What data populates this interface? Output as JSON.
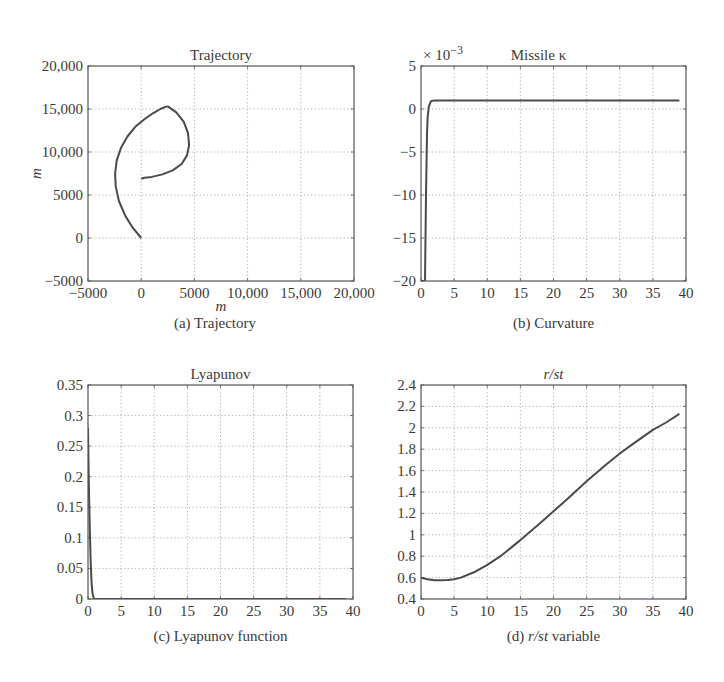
{
  "figure": {
    "line_color": "#4a4a4a",
    "grid_color": "#9a9a9a",
    "axis_color": "#555555"
  },
  "chart_data": [
    {
      "id": "a",
      "type": "line",
      "title": "Trajectory",
      "caption": "(a) Trajectory",
      "xlabel": "m",
      "ylabel": "m",
      "xlim": [
        -5000,
        20000
      ],
      "ylim": [
        -5000,
        20000
      ],
      "xticks": [
        -5000,
        0,
        5000,
        10000,
        15000,
        20000
      ],
      "xtick_labels": [
        "−5000",
        "0",
        "5000",
        "10,000",
        "15,000",
        "20,000"
      ],
      "yticks": [
        -5000,
        0,
        5000,
        10000,
        15000,
        20000
      ],
      "ytick_labels": [
        "−5000",
        "0",
        "5000",
        "10,000",
        "15,000",
        "20,000"
      ],
      "grid": true,
      "exponent_label": "",
      "series": [
        {
          "name": "missile-path",
          "x": [
            0,
            -800,
            -1500,
            -2100,
            -2400,
            -2450,
            -2300,
            -1900,
            -1300,
            -500,
            300,
            1100,
            1800,
            2400,
            2500
          ],
          "y": [
            0,
            1200,
            2600,
            4300,
            6000,
            7500,
            9000,
            10500,
            11800,
            13000,
            13800,
            14500,
            15000,
            15300,
            15300
          ]
        },
        {
          "name": "target-path",
          "x": [
            2500,
            3300,
            4000,
            4400,
            4500,
            4300,
            3800,
            3000,
            2000,
            1000,
            300,
            0
          ],
          "y": [
            15300,
            14600,
            13500,
            12200,
            10800,
            9600,
            8600,
            7900,
            7400,
            7100,
            7000,
            6900
          ]
        }
      ]
    },
    {
      "id": "b",
      "type": "line",
      "title": "Missile κ",
      "caption": "(b) Curvature",
      "xlabel": "",
      "ylabel": "",
      "exponent_label": "× 10−3",
      "xlim": [
        0,
        40
      ],
      "ylim": [
        -20,
        5
      ],
      "xticks": [
        0,
        5,
        10,
        15,
        20,
        25,
        30,
        35,
        40
      ],
      "xtick_labels": [
        "0",
        "5",
        "10",
        "15",
        "20",
        "25",
        "30",
        "35",
        "40"
      ],
      "yticks": [
        -20,
        -15,
        -10,
        -5,
        0,
        5
      ],
      "ytick_labels": [
        "−20",
        "−15",
        "−10",
        "−5",
        "0",
        "5"
      ],
      "grid": true,
      "series": [
        {
          "name": "curvature",
          "x": [
            0,
            0.6,
            0.75,
            0.9,
            1.0,
            1.2,
            1.5,
            2,
            5,
            10,
            20,
            30,
            39
          ],
          "y": [
            -20,
            -20,
            -10,
            -3,
            -1,
            0.3,
            0.9,
            1.0,
            1.0,
            1.0,
            1.0,
            1.0,
            1.0
          ]
        }
      ]
    },
    {
      "id": "c",
      "type": "line",
      "title": "Lyapunov",
      "caption": "(c) Lyapunov function",
      "xlabel": "",
      "ylabel": "",
      "exponent_label": "",
      "xlim": [
        0,
        40
      ],
      "ylim": [
        0,
        0.35
      ],
      "xticks": [
        0,
        5,
        10,
        15,
        20,
        25,
        30,
        35,
        40
      ],
      "xtick_labels": [
        "0",
        "5",
        "10",
        "15",
        "20",
        "25",
        "30",
        "35",
        "40"
      ],
      "yticks": [
        0,
        0.05,
        0.1,
        0.15,
        0.2,
        0.25,
        0.3,
        0.35
      ],
      "ytick_labels": [
        "0",
        "0.05",
        "0.1",
        "0.15",
        "0.2",
        "0.25",
        "0.3",
        "0.35"
      ],
      "grid": true,
      "series": [
        {
          "name": "lyapunov",
          "x": [
            0,
            0.1,
            0.25,
            0.4,
            0.55,
            0.7,
            0.85,
            1.0,
            5,
            20,
            39
          ],
          "y": [
            0.28,
            0.2,
            0.12,
            0.06,
            0.025,
            0.008,
            0.002,
            0,
            0,
            0,
            0
          ]
        }
      ]
    },
    {
      "id": "d",
      "type": "line",
      "title": "r/st",
      "caption": "(d) r/st variable",
      "xlabel": "",
      "ylabel": "",
      "exponent_label": "",
      "xlim": [
        0,
        40
      ],
      "ylim": [
        0.4,
        2.4
      ],
      "xticks": [
        0,
        5,
        10,
        15,
        20,
        25,
        30,
        35,
        40
      ],
      "xtick_labels": [
        "0",
        "5",
        "10",
        "15",
        "20",
        "25",
        "30",
        "35",
        "40"
      ],
      "yticks": [
        0.4,
        0.6,
        0.8,
        1.0,
        1.2,
        1.4,
        1.6,
        1.8,
        2.0,
        2.2,
        2.4
      ],
      "ytick_labels": [
        "0.4",
        "0.6",
        "0.8",
        "1",
        "1.2",
        "1.4",
        "1.6",
        "1.8",
        "2",
        "2.2",
        "2.4"
      ],
      "grid": true,
      "series": [
        {
          "name": "r-over-st",
          "x": [
            0,
            1,
            2,
            3,
            4,
            5,
            6,
            8,
            10,
            12,
            15,
            18,
            20,
            22,
            25,
            28,
            30,
            32,
            35,
            37,
            39
          ],
          "y": [
            0.6,
            0.585,
            0.575,
            0.575,
            0.578,
            0.585,
            0.6,
            0.65,
            0.72,
            0.8,
            0.95,
            1.11,
            1.22,
            1.33,
            1.5,
            1.66,
            1.76,
            1.85,
            1.98,
            2.05,
            2.13
          ]
        }
      ]
    }
  ],
  "layout": {
    "panels": [
      {
        "id": "a",
        "left": 88,
        "top": 66,
        "right": 354,
        "bottom": 281
      },
      {
        "id": "b",
        "left": 421,
        "top": 66,
        "right": 686,
        "bottom": 281
      },
      {
        "id": "c",
        "left": 88,
        "top": 385,
        "right": 353,
        "bottom": 599
      },
      {
        "id": "d",
        "left": 421,
        "top": 385,
        "right": 686,
        "bottom": 599
      }
    ]
  }
}
